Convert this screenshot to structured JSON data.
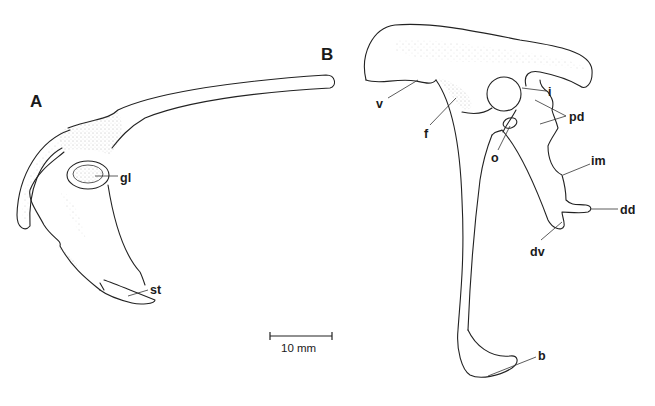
{
  "figure": {
    "panels": [
      {
        "id": "A",
        "letter": "A",
        "labels": [
          {
            "key": "gl",
            "text": "gl"
          },
          {
            "key": "st",
            "text": "st"
          }
        ]
      },
      {
        "id": "B",
        "letter": "B",
        "labels": [
          {
            "key": "v",
            "text": "v"
          },
          {
            "key": "f",
            "text": "f"
          },
          {
            "key": "i",
            "text": "i"
          },
          {
            "key": "pd",
            "text": "pd"
          },
          {
            "key": "o",
            "text": "o"
          },
          {
            "key": "im",
            "text": "im"
          },
          {
            "key": "dd",
            "text": "dd"
          },
          {
            "key": "dv",
            "text": "dv"
          },
          {
            "key": "b",
            "text": "b"
          }
        ]
      }
    ],
    "scale_bar": {
      "text": "10 mm"
    },
    "colors": {
      "ink": "#222222",
      "stipple": "#888888",
      "background": "#ffffff"
    }
  }
}
